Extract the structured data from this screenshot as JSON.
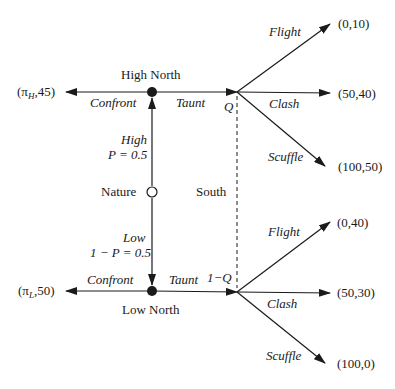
{
  "diagram": {
    "type": "extensive-form game tree",
    "colors": {
      "line": "#1a1a1a",
      "background": "#ffffff"
    },
    "nodes": {
      "high_north": {
        "label": "High North"
      },
      "low_north": {
        "label": "Low North"
      },
      "nature": {
        "label": "Nature"
      },
      "south_info_set": {
        "label": "South",
        "upper_belief": "Q",
        "lower_belief": "1−Q"
      }
    },
    "nature_moves": {
      "high": {
        "label": "High",
        "prob": "P = 0.5"
      },
      "low": {
        "label": "Low",
        "prob": "1 − P = 0.5"
      }
    },
    "north_moves": {
      "confront": "Confront",
      "taunt": "Taunt"
    },
    "south_moves": {
      "flight": "Flight",
      "clash": "Clash",
      "scuffle": "Scuffle"
    },
    "payoffs": {
      "high_confront": {
        "pi": "π",
        "sub": "H",
        "rest": ",45)"
      },
      "low_confront": {
        "pi": "π",
        "sub": "L",
        "rest": ",50)"
      },
      "high_flight": "(0,10)",
      "high_clash": "(50,40)",
      "high_scuffle": "(100,50)",
      "low_flight": "(0,40)",
      "low_clash": "(50,30)",
      "low_scuffle": "(100,0)"
    }
  }
}
